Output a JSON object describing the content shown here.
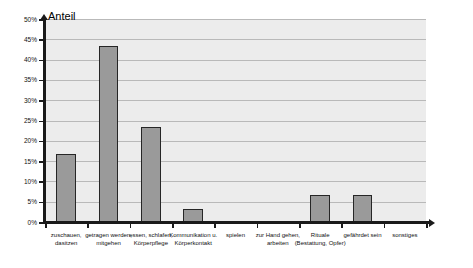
{
  "chart_data": {
    "type": "bar",
    "title": "Anteil",
    "xlabel": "",
    "ylabel": "Anteil",
    "ylim": [
      0,
      50
    ],
    "yunit": "%",
    "grid": true,
    "legend": false,
    "bar_color": "#9a9a9a",
    "bar_border_color": "#262626",
    "plot_background": "#ececec",
    "gridline_color": "#b9b9b9",
    "axis_color": "#1a1a1a",
    "categories": [
      "zuschauen, dasitzen",
      "getragen werden, mitgehen",
      "essen, schlafen, Körperpflege",
      "Kommunikation u. Körperkontakt",
      "spielen",
      "zur Hand gehen, arbeiten",
      "Rituale (Bestattung, Opfer)",
      "gefährdet sein",
      "sonstiges"
    ],
    "values": [
      16.7,
      43.3,
      23.5,
      3.3,
      0,
      0,
      6.7,
      6.7,
      0
    ],
    "ytick_labels": [
      "0%",
      "5%",
      "10%",
      "15%",
      "20%",
      "25%",
      "30%",
      "35%",
      "40%",
      "45%",
      "50%"
    ],
    "ytick_values": [
      0,
      5,
      10,
      15,
      20,
      25,
      30,
      35,
      40,
      45,
      50
    ]
  }
}
